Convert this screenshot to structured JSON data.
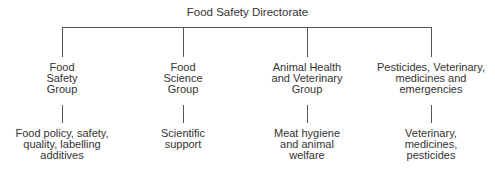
{
  "diagram": {
    "root": "Food Safety Directorate",
    "groups": [
      {
        "name": [
          "Food",
          "Safety",
          "Group"
        ],
        "sub": [
          "Food policy, safety,",
          "quality, labelling",
          "additives"
        ]
      },
      {
        "name": [
          "Food",
          "Science",
          "Group"
        ],
        "sub": [
          "Scientific",
          "support"
        ]
      },
      {
        "name": [
          "Animal Health",
          "and Veterinary",
          "Group"
        ],
        "sub": [
          "Meat hygiene",
          "and animal",
          "welfare"
        ]
      },
      {
        "name": [
          "Pesticides, Veterinary,",
          "medicines and",
          "emergencies"
        ],
        "sub": [
          "Veterinary,",
          "medicines,",
          "pesticides"
        ]
      }
    ]
  }
}
